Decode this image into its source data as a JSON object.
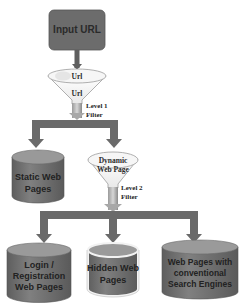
{
  "diagram": {
    "input": {
      "label": "Input URL"
    },
    "filter1": {
      "top_label": "Url",
      "bottom_label": "Url",
      "level_label_line1": "Level 1",
      "level_label_line2": "Filter"
    },
    "filter2": {
      "label_line1": "Dynamic",
      "label_line2": "Web Page",
      "level_label_line1": "Level 2",
      "level_label_line2": "Filter"
    },
    "static_store": {
      "lines": [
        "Static Web",
        "Pages"
      ]
    },
    "outputs": [
      {
        "name": "login-registration",
        "lines": [
          "Login /",
          "Registration",
          "Web Pages"
        ],
        "highlighted": false
      },
      {
        "name": "hidden-web-pages",
        "lines": [
          "Hidden  Web",
          "Pages"
        ],
        "highlighted": true
      },
      {
        "name": "conventional-search",
        "lines": [
          "Web Pages with",
          "conventional",
          "Search Engines"
        ],
        "highlighted": false
      }
    ],
    "colors": {
      "box_fill": "#6e6e6e",
      "cylinder_fill": "#7a7a7a",
      "cylinder_top": "#9a9a9a",
      "arrow_fill": "#6a6a6a",
      "funnel_stroke": "#9c9c9c",
      "highlight_stroke": "#f2f2f2"
    }
  }
}
